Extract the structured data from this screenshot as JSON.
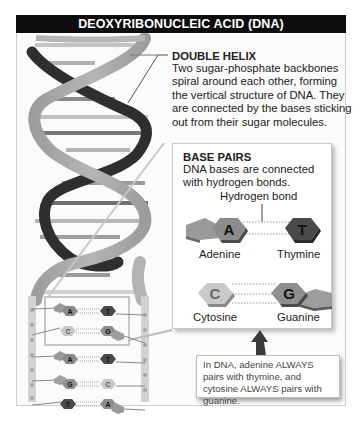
{
  "title": "DEOXYRIBONUCLEIC ACID (DNA)",
  "double_helix": {
    "heading": "DOUBLE HELIX",
    "description": "Two sugar-phosphate backbones spiral around each other, forming the vertical structure of DNA. They are connected by the bases sticking out from their sugar molecules."
  },
  "base_pairs": {
    "heading": "BASE PAIRS",
    "description": "DNA bases are connected with hydrogen bonds.",
    "bond_label": "Hydrogen bond",
    "pairs": [
      {
        "left": {
          "letter": "A",
          "name": "Adenine"
        },
        "right": {
          "letter": "T",
          "name": "Thymine"
        }
      },
      {
        "left": {
          "letter": "C",
          "name": "Cytosine"
        },
        "right": {
          "letter": "G",
          "name": "Guanine"
        }
      }
    ]
  },
  "ladder_pairs": [
    {
      "left": "A",
      "right": "T"
    },
    {
      "left": "C",
      "right": "G"
    },
    {
      "left": "A",
      "right": "T"
    },
    {
      "left": "G",
      "right": "C"
    },
    {
      "left": "T",
      "right": "A"
    }
  ],
  "note": "In DNA, adenine ALWAYS pairs with thymine, and cytosine ALWAYS pairs with guanine.",
  "colors": {
    "title_bar": "#0d0d0d",
    "backbone_light": "#a8a8a8",
    "backbone_dark": "#2e2e2e",
    "adenine": "#8c8c8c",
    "thymine": "#4a4a4a",
    "cytosine": "#c9c9c9",
    "guanine": "#8f8f8f"
  }
}
